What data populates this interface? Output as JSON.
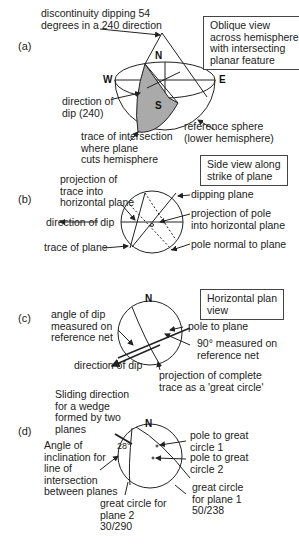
{
  "panels": {
    "a": {
      "label": "(a)",
      "box": "Oblique view\nacross hemisphere\nwith intersecting\nplanar feature",
      "title_note": "discontinuity dipping 54\ndegrees in a 240 direction",
      "north": "N",
      "south": "S",
      "west": "W",
      "east": "E",
      "direction_of_dip": "direction of\ndip (240)",
      "trace": "trace of intersection\nwhere plane\ncuts hemisphere",
      "reference_sphere": "reference sphere\n(lower hemisphere)"
    },
    "b": {
      "label": "(b)",
      "box": "Side view along\nstrike of plane",
      "projection_trace": "projection of\ntrace into\nhorizontal plane",
      "direction_of_dip": "direction of dip",
      "trace_of_plane": "trace of plane",
      "dipping_plane": "dipping plane",
      "projection_pole": "projection of pole\ninto horizontal plane",
      "pole_normal": "pole normal to plane"
    },
    "c": {
      "label": "(c)",
      "box": "Horizontal plan\nview",
      "north": "N",
      "angle_of_dip": "angle of dip\nmeasured on\nreference net",
      "pole_to_plane": "pole to plane",
      "ninety": "90° measured on\nreference net",
      "direction_of_dip": "direction of dip",
      "projection_complete": "projection of complete\ntrace as a 'great circle'"
    },
    "d": {
      "label": "(d)",
      "north": "N",
      "sliding": "Sliding direction\nfor a wedge\nformed by two\nplanes",
      "angle_inclination": "Angle of\ninclination for\nline of\nintersection\nbetween planes",
      "angle_value": "28°",
      "pole_gc1": "pole to great\ncircle 1",
      "pole_gc2": "pole to great\ncircle 2",
      "gc_plane1": "great circle\nfor plane 1\n50/238",
      "gc_plane2": "great circle for\nplane 2\n30/290"
    }
  }
}
